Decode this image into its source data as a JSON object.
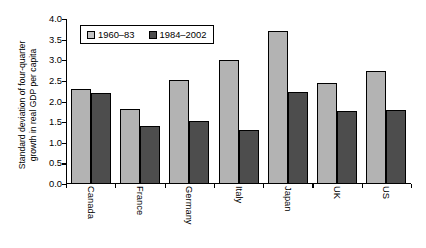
{
  "chart_data": {
    "type": "bar",
    "title": "",
    "xlabel": "",
    "ylabel_line1": "Standard deviation of four-quarter",
    "ylabel_line2": "growth in real GDP per capita",
    "categories": [
      "Canada",
      "France",
      "Germany",
      "Italy",
      "Japan",
      "UK",
      "US"
    ],
    "series": [
      {
        "name": "1960–83",
        "color": "#b3b3b3",
        "values": [
          2.3,
          1.82,
          2.52,
          3.0,
          3.72,
          2.45,
          2.75
        ]
      },
      {
        "name": "1984–2002",
        "color": "#4d4d4d",
        "values": [
          2.2,
          1.4,
          1.52,
          1.3,
          2.22,
          1.78,
          1.8
        ]
      }
    ],
    "ylim": [
      0.0,
      4.0
    ],
    "ytick_step": 0.5,
    "yticks": [
      "0.0",
      "0.5",
      "1.0",
      "1.5",
      "2.0",
      "2.5",
      "3.0",
      "3.5",
      "4.0"
    ],
    "grid": false,
    "legend_position": "top-left-inside",
    "category_label_rotation": 90
  },
  "legend": {
    "entries": [
      {
        "label": "1960–83",
        "swatch": "legend-swatch-light"
      },
      {
        "label": "1984–2002",
        "swatch": "legend-swatch-dark"
      }
    ]
  }
}
